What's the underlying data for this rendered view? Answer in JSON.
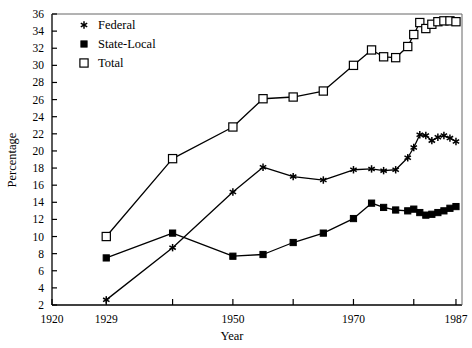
{
  "chart_data": {
    "type": "line",
    "title": "",
    "xlabel": "Year",
    "ylabel": "Percentage",
    "xlim": [
      1920,
      1988
    ],
    "ylim": [
      2,
      36
    ],
    "grid": false,
    "legend_position": "top-left",
    "xticks": [
      1920,
      1929,
      1940,
      1950,
      1960,
      1970,
      1980,
      1987
    ],
    "xtick_labels": [
      "1920",
      "1929",
      "",
      "1950",
      "",
      "1970",
      "",
      "1987"
    ],
    "yticks": [
      2,
      4,
      6,
      8,
      10,
      12,
      14,
      16,
      18,
      20,
      22,
      24,
      26,
      28,
      30,
      32,
      34,
      36
    ],
    "ytick_labels": [
      "2",
      "4",
      "6",
      "8",
      "10",
      "12",
      "14",
      "16",
      "18",
      "20",
      "22",
      "24",
      "26",
      "28",
      "30",
      "32",
      "34",
      "36"
    ],
    "series": [
      {
        "name": "Federal",
        "marker": "asterisk",
        "x": [
          1929,
          1940,
          1950,
          1955,
          1960,
          1965,
          1970,
          1973,
          1975,
          1977,
          1979,
          1980,
          1981,
          1982,
          1983,
          1984,
          1985,
          1986,
          1987
        ],
        "values": [
          2.6,
          8.7,
          15.2,
          18.1,
          17.0,
          16.6,
          17.8,
          17.9,
          17.7,
          17.8,
          19.2,
          20.4,
          21.9,
          21.8,
          21.2,
          21.6,
          21.8,
          21.5,
          21.1
        ]
      },
      {
        "name": "State-Local",
        "marker": "filled-square",
        "x": [
          1929,
          1940,
          1950,
          1955,
          1960,
          1965,
          1970,
          1973,
          1975,
          1977,
          1979,
          1980,
          1981,
          1982,
          1983,
          1984,
          1985,
          1986,
          1987
        ],
        "values": [
          7.5,
          10.4,
          7.7,
          7.9,
          9.3,
          10.4,
          12.1,
          13.9,
          13.4,
          13.1,
          13.0,
          13.2,
          12.8,
          12.5,
          12.6,
          12.8,
          13.0,
          13.3,
          13.5
        ]
      },
      {
        "name": "Total",
        "marker": "open-square",
        "x": [
          1929,
          1940,
          1950,
          1955,
          1960,
          1965,
          1970,
          1973,
          1975,
          1977,
          1979,
          1980,
          1981,
          1982,
          1983,
          1984,
          1985,
          1986,
          1987
        ],
        "values": [
          10.0,
          19.1,
          22.8,
          26.1,
          26.3,
          27.0,
          30.0,
          31.8,
          31.0,
          30.9,
          32.2,
          33.6,
          35.0,
          34.3,
          34.8,
          35.1,
          35.2,
          35.2,
          35.1
        ]
      }
    ]
  },
  "legend": {
    "entries": [
      {
        "label": "Federal",
        "marker": "asterisk-marker"
      },
      {
        "label": "State-Local",
        "marker": "filled-square-marker"
      },
      {
        "label": "Total",
        "marker": "open-square-marker"
      }
    ]
  }
}
